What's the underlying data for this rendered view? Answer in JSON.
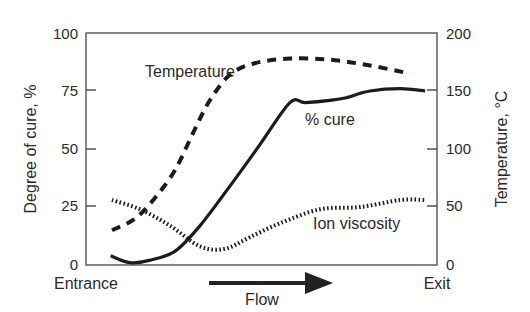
{
  "chart_data": {
    "type": "line",
    "title": "",
    "xlabel": "Flow",
    "x_start_label": "Entrance",
    "x_end_label": "Exit",
    "ylabel_left": "Degree of cure, %",
    "ylabel_right": "Temperature, °C",
    "y_left_ticks": [
      "0",
      "25",
      "50",
      "75",
      "100"
    ],
    "y_right_ticks": [
      "0",
      "50",
      "100",
      "150",
      "200"
    ],
    "ylim_left": [
      0,
      100
    ],
    "ylim_right": [
      0,
      200
    ],
    "grid": false,
    "legend": "inline annotations",
    "series": [
      {
        "name": "% cure",
        "style": "solid",
        "axis": "left",
        "x": [
          0.07,
          0.125,
          0.18,
          0.254,
          0.325,
          0.41,
          0.496,
          0.581,
          0.624,
          0.695,
          0.738,
          0.809,
          0.895,
          0.966
        ],
        "values": [
          4,
          1,
          2,
          6,
          17,
          34,
          52,
          70,
          70,
          71,
          72,
          75,
          76,
          75
        ]
      },
      {
        "name": "Temperature",
        "style": "dashed",
        "axis": "right",
        "x": [
          0.074,
          0.14,
          0.197,
          0.254,
          0.31,
          0.353,
          0.41,
          0.481,
          0.581,
          0.695,
          0.809,
          0.923
        ],
        "values": [
          30,
          40,
          58,
          82,
          117,
          142,
          164,
          174,
          178,
          177,
          172,
          165
        ]
      },
      {
        "name": "Ion viscosity",
        "style": "dotted",
        "axis": "left",
        "x": [
          0.074,
          0.154,
          0.239,
          0.325,
          0.396,
          0.467,
          0.553,
          0.667,
          0.781,
          0.895,
          0.966
        ],
        "values": [
          28,
          24,
          17,
          8,
          7,
          12,
          18,
          24,
          25,
          28,
          28
        ]
      }
    ],
    "annotations": [
      "Temperature",
      "% cure",
      "Ion viscosity"
    ]
  }
}
